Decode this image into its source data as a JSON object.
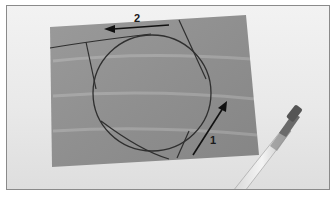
{
  "image": {
    "description": "Photograph of a grey sheet of paper with a hand-drawn circle and tangent lines, arrows labeled 1 and 2, and a pen at lower right",
    "labels": {
      "arrow_1": "1",
      "arrow_2": "2"
    },
    "colors": {
      "paper": "#8e8e8e",
      "background": "#ececec",
      "ink": "#2a2a2a",
      "frame": "#8a8a8a"
    }
  }
}
